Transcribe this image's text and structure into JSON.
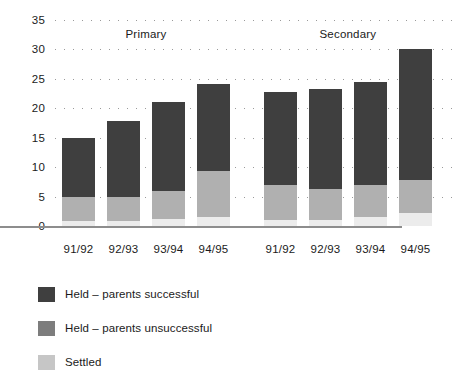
{
  "chart_data": {
    "type": "bar",
    "stacked": true,
    "title": "",
    "subtitle": "",
    "xlabel": "",
    "ylabel": "",
    "ylim": [
      0,
      35
    ],
    "yticks": [
      0,
      5,
      10,
      15,
      20,
      25,
      30,
      35
    ],
    "ytick_labels": [
      "0",
      "5",
      "10",
      "15",
      "20",
      "25",
      "30",
      "35"
    ],
    "grid": true,
    "grid_style": "dotted-horizontal",
    "legend_position": "below",
    "groups": [
      {
        "name": "Primary",
        "label": "Primary"
      },
      {
        "name": "Secondary",
        "label": "Secondary"
      }
    ],
    "categories": [
      "91/92",
      "92/93",
      "93/94",
      "94/95",
      "91/92",
      "92/93",
      "93/94",
      "94/95"
    ],
    "category_groups": [
      "Primary",
      "Primary",
      "Primary",
      "Primary",
      "Secondary",
      "Secondary",
      "Secondary",
      "Secondary"
    ],
    "series": [
      {
        "name": "Settled",
        "color": "#eaeaea",
        "values": [
          0.8,
          0.8,
          1.2,
          1.5,
          1.0,
          1.0,
          1.5,
          2.2
        ]
      },
      {
        "name": "Held – parents unsuccessful",
        "color": "#b4b4b4",
        "values": [
          4.2,
          4.2,
          4.8,
          7.8,
          6.0,
          5.3,
          5.5,
          5.6
        ]
      },
      {
        "name": "Held – parents successful",
        "color": "#7d7d7d",
        "values": [
          0,
          0,
          0,
          0,
          0,
          0,
          0,
          0
        ]
      }
    ],
    "stack_order_bottom_to_top": [
      "Settled",
      "held_unsuccessful",
      "held_successful"
    ],
    "bars": [
      {
        "category": "91/92",
        "group": "Primary",
        "settled": 0.8,
        "held_unsuccessful": 4.2,
        "held_successful": 10.0,
        "total": 15.0
      },
      {
        "category": "92/93",
        "group": "Primary",
        "settled": 0.8,
        "held_unsuccessful": 4.2,
        "held_successful": 12.8,
        "total": 17.8
      },
      {
        "category": "93/94",
        "group": "Primary",
        "settled": 1.2,
        "held_unsuccessful": 4.8,
        "held_successful": 15.0,
        "total": 21.0
      },
      {
        "category": "94/95",
        "group": "Primary",
        "settled": 1.5,
        "held_unsuccessful": 7.8,
        "held_successful": 14.9,
        "total": 24.2
      },
      {
        "category": "91/92",
        "group": "Secondary",
        "settled": 1.0,
        "held_unsuccessful": 6.0,
        "held_successful": 15.7,
        "total": 22.7
      },
      {
        "category": "92/93",
        "group": "Secondary",
        "settled": 1.0,
        "held_unsuccessful": 5.3,
        "held_successful": 17.0,
        "total": 23.3
      },
      {
        "category": "93/94",
        "group": "Secondary",
        "settled": 1.5,
        "held_unsuccessful": 5.5,
        "held_successful": 17.4,
        "total": 24.4
      },
      {
        "category": "94/95",
        "group": "Secondary",
        "settled": 2.2,
        "held_unsuccessful": 5.6,
        "held_successful": 22.2,
        "total": 30.0
      }
    ]
  },
  "legend": {
    "items": [
      {
        "label": "Held – parents successful",
        "color": "#3f3f3f"
      },
      {
        "label": "Held – parents unsuccessful",
        "color": "#7d7d7d"
      },
      {
        "label": "Settled",
        "color": "#c6c6c6"
      }
    ]
  },
  "colors": {
    "held_successful": "#3f3f3f",
    "held_unsuccessful": "#7d7d7d",
    "settled": "#c6c6c6",
    "settled_bar": "#ececec",
    "unsuccessful_bar": "#b0b0b0",
    "axis": "#8d8d8d",
    "grid": "#9a9a9a",
    "text": "#1a1a1a",
    "background": "#ffffff"
  }
}
